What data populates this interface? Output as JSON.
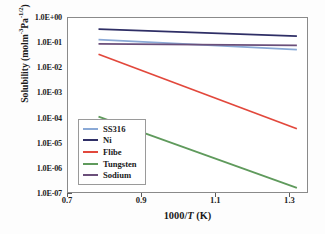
{
  "chart_data": {
    "type": "line",
    "title": "",
    "xlabel": "1000/T (K)",
    "xlabel_prefix": "1000/",
    "xlabel_italic": "T",
    "xlabel_suffix": " (K)",
    "ylabel": "Solubility (molm-3Pa-1/2)",
    "ylabel_prefix": "Solubility (molm",
    "ylabel_sup1": "-3",
    "ylabel_mid": "Pa",
    "ylabel_sup2": "-1/2",
    "ylabel_suffix": ")",
    "xscale": "linear",
    "yscale": "log",
    "xlim": [
      0.7,
      1.35
    ],
    "ylim": [
      1e-07,
      1.0
    ],
    "grid": false,
    "legend_position": "lower-left-inside",
    "xticks": [
      0.7,
      0.9,
      1.1,
      1.3
    ],
    "xtick_labels": [
      "0.7",
      "0.9",
      "1.1",
      "1.3"
    ],
    "yticks": [
      1.0,
      0.1,
      0.01,
      0.001,
      0.0001,
      1e-05,
      1e-06,
      1e-07
    ],
    "ytick_labels": [
      "1.0E+00",
      "1.0E-01",
      "1.0E-02",
      "1.0E-03",
      "1.0E-04",
      "1.0E-05",
      "1.0E-06",
      "1.0E-07"
    ],
    "series": [
      {
        "name": "SS316",
        "color": "#8aa9d6",
        "x": [
          0.785,
          1.32
        ],
        "y": [
          0.125,
          0.05
        ]
      },
      {
        "name": "Ni",
        "color": "#2f2f66",
        "x": [
          0.785,
          1.32
        ],
        "y": [
          0.33,
          0.175
        ]
      },
      {
        "name": "Flibe",
        "color": "#e2483c",
        "x": [
          0.785,
          1.32
        ],
        "y": [
          0.033,
          3.6e-05
        ]
      },
      {
        "name": "Tungsten",
        "color": "#5f9a5c",
        "x": [
          0.785,
          1.32
        ],
        "y": [
          0.00011,
          1.6e-07
        ]
      },
      {
        "name": "Sodium",
        "color": "#6b4f7a",
        "x": [
          0.785,
          1.32
        ],
        "y": [
          0.085,
          0.074
        ]
      }
    ]
  },
  "legend": {
    "items": [
      {
        "label": "SS316",
        "color": "#8aa9d6"
      },
      {
        "label": "Ni",
        "color": "#2f2f66"
      },
      {
        "label": "Flibe",
        "color": "#e2483c"
      },
      {
        "label": "Tungsten",
        "color": "#5f9a5c"
      },
      {
        "label": "Sodium",
        "color": "#6b4f7a"
      }
    ]
  },
  "colors": {
    "frame": "#8a8a8a",
    "text": "#1a1a1a",
    "plot_background": "#ffffff",
    "figure_background": "#fdfdfd"
  }
}
